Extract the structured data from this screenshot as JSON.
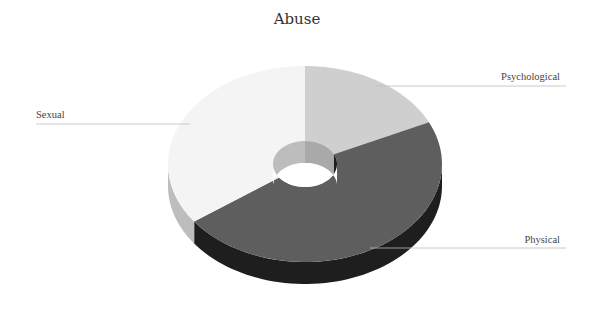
{
  "chart_data": {
    "type": "pie",
    "subtype": "3d-donut",
    "title": "Abuse",
    "categories": [
      "Psychological",
      "Physical",
      "Sexual"
    ],
    "values": [
      18,
      47,
      35
    ],
    "unit": "percent (estimated from slice angles; no data labels shown)",
    "colors": [
      "#cfcfcf",
      "#5e5e5e",
      "#f4f4f4"
    ],
    "side_colors": [
      "#a9a9a9",
      "#1e1e1e",
      "#bdbdbd"
    ],
    "legend": "none",
    "labels_position": "outside with leader lines",
    "start_angle_deg": 0,
    "direction": "clockwise"
  },
  "labels": {
    "title": "Abuse",
    "psychological": "Psychological",
    "physical": "Physical",
    "sexual": "Sexual"
  }
}
